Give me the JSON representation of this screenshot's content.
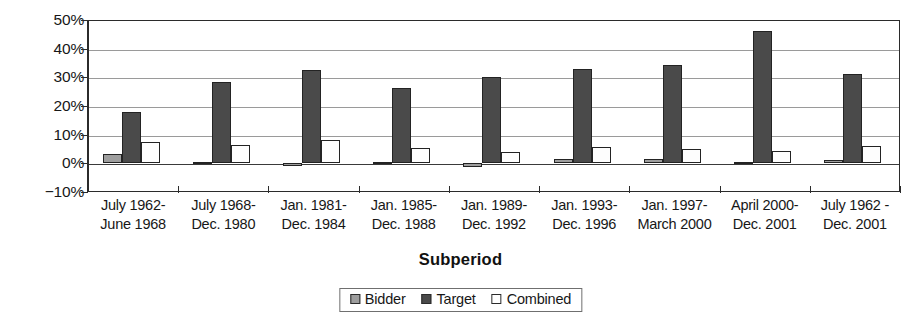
{
  "chart_data": {
    "type": "bar",
    "title": "",
    "xlabel": "Subperiod",
    "ylabel": "",
    "ylim": [
      -10,
      50
    ],
    "ytick_step": 10,
    "ytick_labels": [
      "50%",
      "40%",
      "30%",
      "20%",
      "10%",
      "0%",
      "−10%"
    ],
    "ytick_values": [
      50,
      40,
      30,
      20,
      10,
      0,
      -10
    ],
    "grid": true,
    "value_suffix": "%",
    "legend_position": "bottom-center",
    "categories": [
      "July 1962-\nJune 1968",
      "July 1968-\nDec. 1980",
      "Jan. 1981-\nDec. 1984",
      "Jan. 1985-\nDec. 1988",
      "Jan. 1989-\nDec. 1992",
      "Jan. 1993-\nDec. 1996",
      "Jan. 1997-\nMarch 2000",
      "April 2000-\nDec. 2001",
      "July 1962 -\nDec. 2001"
    ],
    "category_lines": [
      [
        "July 1962-",
        "June 1968"
      ],
      [
        "July 1968-",
        "Dec. 1980"
      ],
      [
        "Jan. 1981-",
        "Dec. 1984"
      ],
      [
        "Jan. 1985-",
        "Dec. 1988"
      ],
      [
        "Jan. 1989-",
        "Dec. 1992"
      ],
      [
        "Jan. 1993-",
        "Dec. 1996"
      ],
      [
        "Jan. 1997-",
        "March 2000"
      ],
      [
        "April 2000-",
        "Dec. 2001"
      ],
      [
        "July 1962 -",
        "Dec. 2001"
      ]
    ],
    "series": [
      {
        "name": "Bidder",
        "color": "#9e9e9e",
        "values": [
          3.2,
          0.4,
          -1.0,
          0.4,
          -1.3,
          1.4,
          1.5,
          0.6,
          1.0
        ]
      },
      {
        "name": "Target",
        "color": "#4a4a4a",
        "values": [
          18.0,
          28.2,
          32.5,
          26.2,
          30.0,
          32.8,
          34.2,
          46.0,
          31.0
        ]
      },
      {
        "name": "Combined",
        "color": "#ffffff",
        "values": [
          7.4,
          6.5,
          8.1,
          5.3,
          4.0,
          5.7,
          5.0,
          4.2,
          6.2
        ]
      }
    ]
  },
  "legend": {
    "items": [
      {
        "label": "Bidder",
        "swatch": "bidder-swatch-icon"
      },
      {
        "label": "Target",
        "swatch": "target-swatch-icon"
      },
      {
        "label": "Combined",
        "swatch": "combined-swatch-icon"
      }
    ]
  },
  "axis_title": "Subperiod",
  "colors": {
    "bidder": "#9e9e9e",
    "target": "#4a4a4a",
    "combined": "#ffffff",
    "gridline": "#9a9a9a",
    "frame": "#2b2b2b",
    "text": "#171717"
  }
}
